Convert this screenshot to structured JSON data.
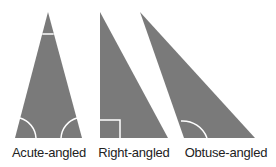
{
  "colors": {
    "fill": "#7a7a7a",
    "mark": "#ffffff",
    "text": "#222222"
  },
  "triangles": [
    {
      "label": "Acute-angled",
      "center_x": 49
    },
    {
      "label": "Right-angled",
      "center_x": 134
    },
    {
      "label": "Obtuse-angled",
      "center_x": 226
    }
  ]
}
